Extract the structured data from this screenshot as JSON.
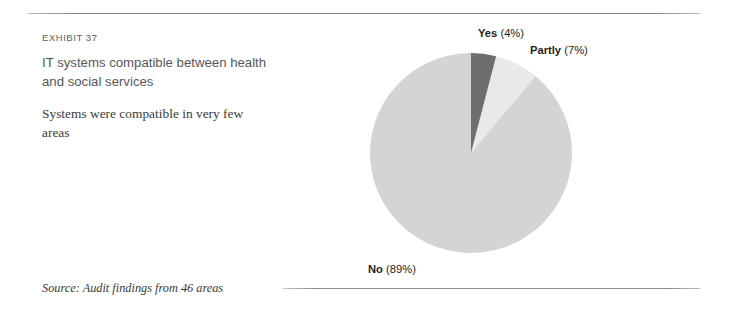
{
  "exhibit": {
    "label": "EXHIBIT 37",
    "title": "IT systems compatible between health and social services",
    "subtitle": "Systems were compatible in very few areas"
  },
  "source": {
    "text": "Source: Audit findings from 46 areas"
  },
  "labels": {
    "yes_name": "Yes",
    "yes_pct": " (4%)",
    "partly_name": "Partly",
    "partly_pct": " (7%)",
    "no_name": "No",
    "no_pct": " (89%)"
  },
  "colors": {
    "yes": "#6e6e6e",
    "partly": "#e9e9e9",
    "no": "#d4d4d4",
    "rule": "#8d8d8d",
    "title_text": "#55575a",
    "body_text": "#3b3b3b"
  },
  "chart_data": {
    "type": "pie",
    "title": "IT systems compatible between health and social services",
    "subtitle": "Systems were compatible in very few areas",
    "categories": [
      "Yes",
      "Partly",
      "No"
    ],
    "values": [
      4,
      7,
      89
    ],
    "unit": "%",
    "labels": [
      "Yes (4%)",
      "Partly (7%)",
      "No (89%)"
    ],
    "colors": [
      "#6e6e6e",
      "#e9e9e9",
      "#d4d4d4"
    ],
    "start_angle_deg": 0,
    "direction": "clockwise",
    "legend": "none",
    "grid": false,
    "source": "Audit findings from 46 areas"
  }
}
